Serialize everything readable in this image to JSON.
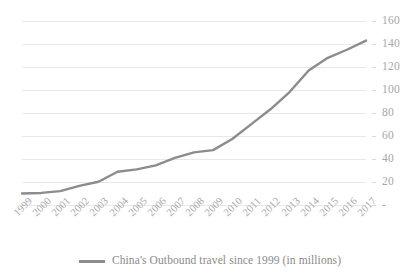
{
  "chart_data": {
    "type": "line",
    "title": "",
    "xlabel": "",
    "ylabel": "",
    "categories": [
      "1999",
      "2000",
      "2001",
      "2002",
      "2003",
      "2004",
      "2005",
      "2006",
      "2007",
      "2008",
      "2009",
      "2010",
      "2011",
      "2012",
      "2013",
      "2014",
      "2015",
      "2016",
      "2017"
    ],
    "series": [
      {
        "name": "China's Outbound travel since 1999 (in millions)",
        "color": "#8c8c8c",
        "values": [
          10.0,
          10.5,
          12.1,
          16.6,
          20.2,
          28.9,
          31.0,
          34.5,
          40.9,
          45.8,
          47.7,
          57.4,
          70.3,
          83.2,
          98.2,
          117.0,
          128.0,
          135.0,
          143.0
        ]
      }
    ],
    "ytick_labels": [
      "-",
      "20",
      "40",
      "60",
      "80",
      "100",
      "120",
      "140",
      "160"
    ],
    "ytick_values": [
      0,
      20,
      40,
      60,
      80,
      100,
      120,
      140,
      160
    ],
    "ylim": [
      0,
      160
    ],
    "grid": true,
    "grid_color": "#e8e8e8",
    "y_axis_position": "right",
    "x_label_rotation": -45,
    "legend_position": "bottom",
    "markers": false
  },
  "legend": {
    "entries": [
      {
        "label": "China's Outbound travel since 1999 (in millions)",
        "color": "#8c8c8c"
      }
    ]
  },
  "colors": {
    "series_line": "#8c8c8c",
    "gridline": "#e8e8e8",
    "tick_text": "#a6a6a6",
    "legend_text": "#8a8a8a",
    "background": "#ffffff"
  }
}
